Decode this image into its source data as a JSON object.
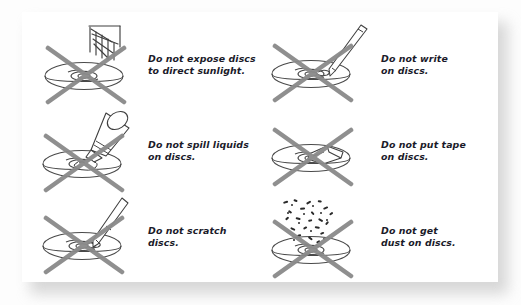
{
  "figure": {
    "background_color": "#fdfdfd",
    "card_color": "#ffffff",
    "text_color": "#1b1b2a",
    "cross_color": "#8a8a8a",
    "line_color": "#4a4a4a"
  },
  "panels": [
    {
      "id": "sunlight",
      "icon": "sun-rays-over-disc-icon",
      "caption": "Do not expose discs\nto direct sunlight."
    },
    {
      "id": "write",
      "icon": "pen-writing-on-disc-icon",
      "caption": "Do not write\non discs."
    },
    {
      "id": "liquids",
      "icon": "bottle-spilling-liquid-on-disc-icon",
      "caption": "Do not spill liquids\non discs."
    },
    {
      "id": "tape",
      "icon": "tape-on-disc-icon",
      "caption": "Do not put tape\non discs."
    },
    {
      "id": "scratch",
      "icon": "sharp-tool-scratching-disc-icon",
      "caption": "Do not scratch\ndiscs."
    },
    {
      "id": "dust",
      "icon": "dust-particles-over-disc-icon",
      "caption": "Do not get\ndust on discs."
    }
  ]
}
